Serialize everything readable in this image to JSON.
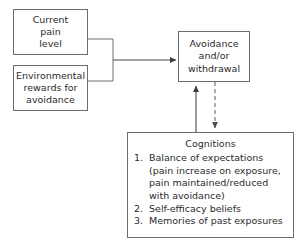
{
  "diagram": {
    "stroke_color": "#6e6e6e",
    "arrow_color": "#4a4a4a",
    "text_color": "#2b2b2b",
    "background_color": "#ffffff",
    "nodes": {
      "current_pain": {
        "lines": [
          "Current",
          "pain",
          "level"
        ]
      },
      "environmental_rewards": {
        "lines": [
          "Environmental",
          "rewards for",
          "avoidance"
        ]
      },
      "avoidance": {
        "lines": [
          "Avoidance",
          "and/or",
          "withdrawal"
        ]
      },
      "cognitions": {
        "title": "Cognitions",
        "items": [
          {
            "number": "1.",
            "lines": [
              "Balance of expectations",
              "(pain increase on exposure,",
              "pain maintained/reduced",
              "with avoidance)"
            ]
          },
          {
            "number": "2.",
            "lines": [
              "Self-efficacy beliefs"
            ]
          },
          {
            "number": "3.",
            "lines": [
              "Memories of past exposures"
            ]
          }
        ]
      }
    },
    "connectors": [
      {
        "name": "inputs-to-avoidance",
        "style": "solid",
        "arrowhead": "end",
        "from": "current-pain-and-environmental-rewards",
        "to": "avoidance"
      },
      {
        "name": "cognitions-to-avoidance",
        "style": "solid",
        "arrowhead": "end",
        "from": "cognitions",
        "to": "avoidance"
      },
      {
        "name": "avoidance-to-cognitions",
        "style": "dashed",
        "arrowhead": "end",
        "from": "avoidance",
        "to": "cognitions"
      }
    ]
  }
}
